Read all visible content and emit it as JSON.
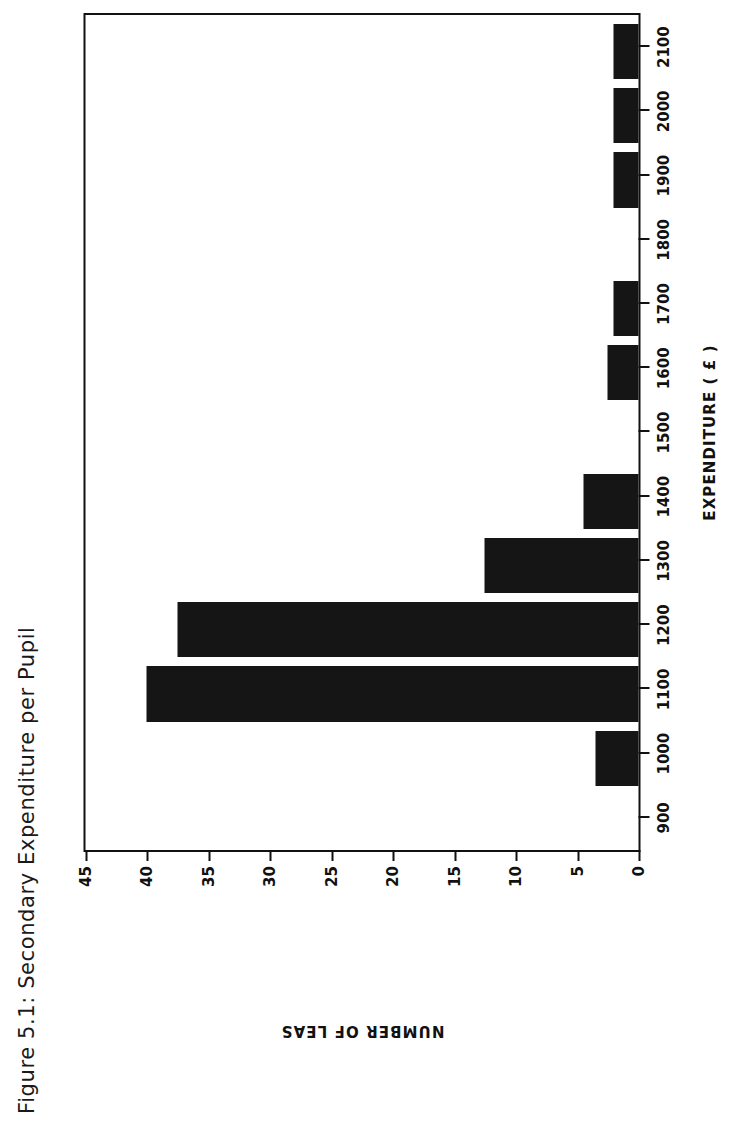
{
  "figure": {
    "caption": "Figure 5.1: Secondary Expenditure per Pupil"
  },
  "axes": {
    "x_title": "EXPENDITURE ( £ )",
    "y_title": "NUMBER OF LEAS"
  },
  "chart_data": {
    "type": "bar",
    "title": "Figure 5.1: Secondary Expenditure per Pupil",
    "orientation": "vertical",
    "xlabel": "EXPENDITURE ( £ )",
    "ylabel": "NUMBER OF LEAS",
    "categories": [
      900,
      1000,
      1100,
      1200,
      1300,
      1400,
      1500,
      1600,
      1700,
      1800,
      1900,
      2000,
      2100
    ],
    "values": [
      0,
      3.5,
      40,
      37.5,
      12.5,
      4.5,
      0,
      2.5,
      2,
      0,
      2,
      2,
      2
    ],
    "xlim": [
      850,
      2150
    ],
    "ylim": [
      0,
      45
    ],
    "yticks": [
      0,
      5,
      10,
      15,
      20,
      25,
      30,
      35,
      40,
      45
    ],
    "xticks": [
      900,
      1000,
      1100,
      1200,
      1300,
      1400,
      1500,
      1600,
      1700,
      1800,
      1900,
      2000,
      2100
    ],
    "xtick_labels": [
      "900",
      "1000",
      "1100",
      "1200",
      "1300",
      "1400",
      "1500",
      "1600",
      "1700",
      "1800",
      "1900",
      "2000",
      "2100"
    ],
    "ytick_labels": [
      "0",
      "5",
      "10",
      "15",
      "20",
      "25",
      "30",
      "35",
      "40",
      "45"
    ],
    "grid": false,
    "legend": false,
    "bar_color": "#151515"
  }
}
